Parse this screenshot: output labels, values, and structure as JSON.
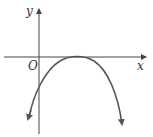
{
  "diagram": {
    "type": "coordinate-graph",
    "labels": {
      "y_axis": "y",
      "x_axis": "x",
      "origin": "O"
    },
    "colors": {
      "axes": "#444444",
      "curve": "#555555",
      "background": "#ffffff"
    }
  }
}
